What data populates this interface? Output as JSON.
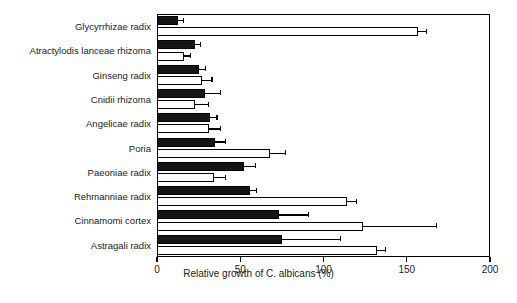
{
  "chart_data": {
    "type": "bar",
    "orientation": "horizontal",
    "title": "",
    "xlabel": "Relative growth of C. albicans (%)",
    "ylabel": "",
    "xlim": [
      0,
      200
    ],
    "xticks": [
      0,
      50,
      100,
      150,
      200
    ],
    "xticklabels": [
      "0",
      "50",
      "100",
      "150",
      "200"
    ],
    "grid": false,
    "legend": "none",
    "categories": [
      "Glycyrrhizae radix",
      "Atractylodis lanceae rhizoma",
      "Ginseng radix",
      "Cnidii  rhizoma",
      "Angelicae radix",
      "Poria",
      "Paeoniae radix",
      "Rehmanniae radix",
      "Cinnamomi cortex",
      "Astragali radix"
    ],
    "series": [
      {
        "name": "filled",
        "style": "solid-black",
        "values": [
          12.5,
          23,
          25,
          29,
          32,
          35,
          52,
          56,
          73,
          75
        ],
        "errors": [
          3.5,
          3,
          4,
          9,
          4,
          6,
          7,
          4,
          18,
          35
        ]
      },
      {
        "name": "open",
        "style": "open-white",
        "values": [
          157,
          16,
          27,
          23,
          31,
          68,
          34,
          114,
          124,
          132
        ],
        "errors": [
          5,
          4,
          6,
          8,
          7,
          9,
          7,
          6,
          44,
          5
        ]
      }
    ]
  }
}
